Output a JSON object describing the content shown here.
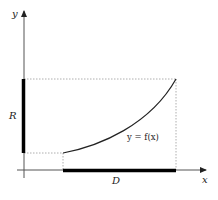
{
  "diagram": {
    "axes": {
      "x_label": "x",
      "y_label": "y"
    },
    "labels": {
      "range": "R",
      "domain": "D",
      "function": "y = f(x)"
    },
    "colors": {
      "axis": "#555555",
      "bar": "#000000",
      "curve": "#222222",
      "guide": "#999999"
    }
  }
}
